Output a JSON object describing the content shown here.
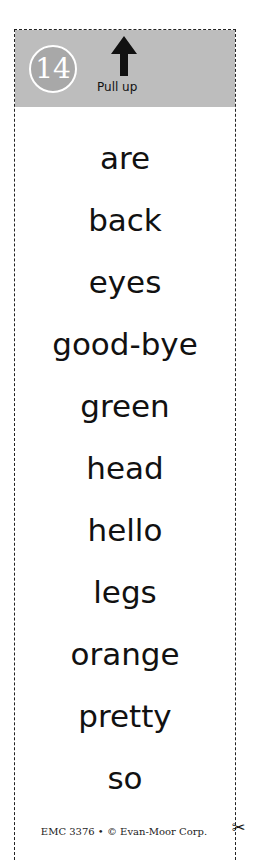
{
  "header": {
    "number": "14",
    "arrow_icon": "arrow-up-icon",
    "instruction": "Pull up"
  },
  "words": [
    "are",
    "back",
    "eyes",
    "good-bye",
    "green",
    "head",
    "hello",
    "legs",
    "orange",
    "pretty",
    "so"
  ],
  "footer": {
    "credit": "EMC 3376 • © Evan-Moor Corp."
  },
  "icons": {
    "scissors": "✂"
  },
  "colors": {
    "header_bg": "#bdbdbd",
    "badge_bg": "#a8a8a8"
  }
}
